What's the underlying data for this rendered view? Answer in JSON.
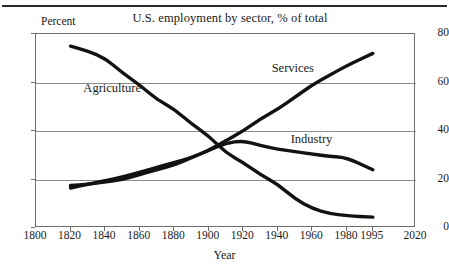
{
  "chart_data": {
    "type": "line",
    "title": "U.S. employment by sector, % of total",
    "xlabel": "Year",
    "ylabel": "Percent",
    "xlim": [
      1800,
      2020
    ],
    "ylim": [
      0,
      80
    ],
    "grid": "horizontal",
    "legend_position": "inline-annotations",
    "xticks": [
      "1800",
      "1820",
      "1840",
      "1860",
      "1880",
      "1900",
      "1920",
      "1940",
      "1960",
      "1980",
      "1995",
      "2020"
    ],
    "yticks": [
      "0",
      "20",
      "40",
      "60",
      "80"
    ],
    "series": [
      {
        "name": "Agriculture",
        "label_x": 1828,
        "label_y": 57,
        "x": [
          1820,
          1830,
          1840,
          1850,
          1860,
          1870,
          1880,
          1890,
          1900,
          1910,
          1920,
          1930,
          1940,
          1950,
          1960,
          1970,
          1980,
          1995
        ],
        "values": [
          75,
          73,
          70,
          64,
          59,
          53,
          49,
          43,
          38,
          31,
          27,
          22,
          18,
          12,
          8,
          6,
          5,
          4.5
        ]
      },
      {
        "name": "Services",
        "label_x": 1937,
        "label_y": 65,
        "x": [
          1820,
          1830,
          1840,
          1850,
          1860,
          1870,
          1880,
          1890,
          1900,
          1910,
          1920,
          1930,
          1940,
          1950,
          1960,
          1970,
          1980,
          1995
        ],
        "values": [
          17.5,
          18,
          19,
          20,
          22,
          24,
          26,
          29,
          32,
          36,
          40,
          45,
          49,
          54,
          59,
          63,
          67,
          72
        ]
      },
      {
        "name": "Industry",
        "label_x": 1948,
        "label_y": 36,
        "x": [
          1820,
          1830,
          1840,
          1850,
          1860,
          1870,
          1880,
          1890,
          1900,
          1910,
          1920,
          1930,
          1940,
          1950,
          1960,
          1970,
          1980,
          1995
        ],
        "values": [
          16.5,
          18,
          19.5,
          21,
          23,
          25,
          27,
          29,
          32,
          35,
          36,
          34,
          32.5,
          31.5,
          30.5,
          29.5,
          29,
          24
        ]
      }
    ]
  },
  "caption": ""
}
